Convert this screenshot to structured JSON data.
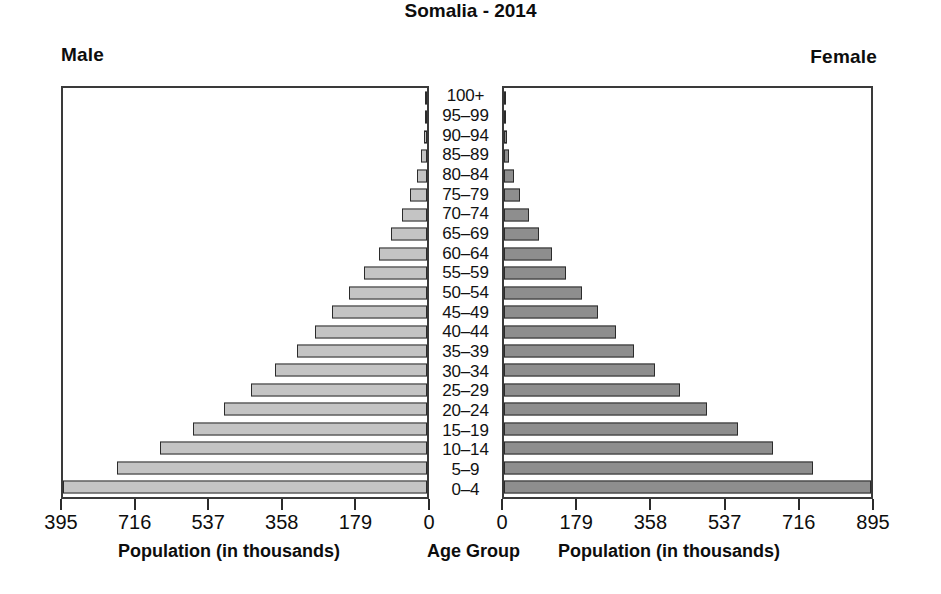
{
  "header": {
    "title": "Somalia - 2014",
    "male_label": "Male",
    "female_label": "Female"
  },
  "captions": {
    "male_axis": "Population (in thousands)",
    "age_axis": "Age Group",
    "female_axis": "Population (in thousands)"
  },
  "axis": {
    "male_ticks": [
      "395",
      "716",
      "537",
      "358",
      "179",
      "0"
    ],
    "female_ticks": [
      "0",
      "179",
      "358",
      "537",
      "716",
      "895"
    ]
  },
  "colors": {
    "male_bar": "#c4c4c4",
    "female_bar": "#8e8e8e",
    "bar_outline": "#2b2b2b",
    "frame": "#3a3a3a",
    "text": "#0d0d0d"
  },
  "chart_data": {
    "type": "bar",
    "subtype": "population-pyramid",
    "title": "Somalia - 2014",
    "xlabel": "Population (in thousands)",
    "ylabel": "Age Group",
    "grid": false,
    "legend": [
      "Male",
      "Female"
    ],
    "legend_position": "top-left and top-right",
    "units": "thousands",
    "categories": [
      "0-4",
      "5-9",
      "10-14",
      "15-19",
      "20-24",
      "25-29",
      "30-34",
      "35-39",
      "40-44",
      "45-49",
      "50-54",
      "55-59",
      "60-64",
      "65-69",
      "70-74",
      "75-79",
      "80-84",
      "85-89",
      "90-94",
      "95-99",
      "100+"
    ],
    "male_axis_ticks": [
      895,
      716,
      537,
      358,
      179,
      0
    ],
    "male_axis_tick_labels": [
      "395",
      "716",
      "537",
      "358",
      "179",
      "0"
    ],
    "female_axis_ticks": [
      0,
      179,
      358,
      537,
      716,
      895
    ],
    "female_axis_tick_labels": [
      "0",
      "179",
      "358",
      "537",
      "716",
      "895"
    ],
    "xlim_male": [
      895,
      0
    ],
    "xlim_female": [
      0,
      895
    ],
    "series": [
      {
        "name": "Male",
        "color": "#c4c4c4",
        "values": [
          895,
          763,
          657,
          576,
          500,
          432,
          373,
          320,
          275,
          233,
          193,
          155,
          119,
          88,
          62,
          41,
          25,
          14,
          8,
          5,
          4
        ]
      },
      {
        "name": "Female",
        "color": "#8e8e8e",
        "values": [
          895,
          753,
          655,
          570,
          495,
          428,
          368,
          316,
          272,
          230,
          190,
          152,
          117,
          86,
          60,
          40,
          24,
          13,
          8,
          5,
          4
        ]
      }
    ]
  }
}
